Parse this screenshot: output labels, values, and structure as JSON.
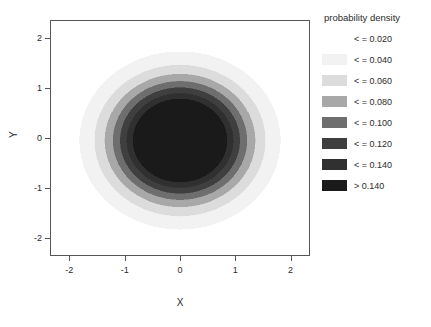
{
  "figure": {
    "background": "#ffffff",
    "frame_color": "#555555"
  },
  "legend": {
    "title": "probability density",
    "rows": [
      {
        "label": "< = 0.020",
        "color": "#ffffff"
      },
      {
        "label": "< = 0.040",
        "color": "#f2f2f2"
      },
      {
        "label": "< = 0.060",
        "color": "#dcdcdc"
      },
      {
        "label": "< = 0.080",
        "color": "#a8a8a8"
      },
      {
        "label": "< = 0.100",
        "color": "#6e6e6e"
      },
      {
        "label": "< = 0.120",
        "color": "#3f3f3f"
      },
      {
        "label": "< = 0.140",
        "color": "#303030"
      },
      {
        "label": "> 0.140",
        "color": "#1a1a1a"
      }
    ]
  },
  "axes": {
    "x": {
      "title": "X",
      "ticks": [
        "-2",
        "-1",
        "0",
        "1",
        "2"
      ],
      "tick_values": [
        -2,
        -1,
        0,
        1,
        2
      ],
      "range": [
        -2.35,
        2.35
      ]
    },
    "y": {
      "title": "Y",
      "ticks": [
        "-2",
        "-1",
        "0",
        "1",
        "2"
      ],
      "tick_values": [
        -2,
        -1,
        0,
        1,
        2
      ],
      "range": [
        -2.35,
        2.35
      ]
    }
  },
  "chart_data": {
    "type": "heatmap",
    "title": "",
    "subtitle": "",
    "xlabel": "X",
    "ylabel": "Y",
    "xlim": [
      -2.35,
      2.35
    ],
    "ylim": [
      -2.35,
      2.35
    ],
    "grid": false,
    "legend_position": "right",
    "legend_title": "probability density",
    "colorscale": "grayscale-discrete",
    "levels": [
      0.02,
      0.04,
      0.06,
      0.08,
      0.1,
      0.12,
      0.14
    ],
    "level_labels": [
      "< = 0.020",
      "< = 0.040",
      "< = 0.060",
      "< = 0.080",
      "< = 0.100",
      "< = 0.120",
      "< = 0.140",
      "> 0.140"
    ],
    "level_colors": [
      "#ffffff",
      "#f2f2f2",
      "#dcdcdc",
      "#a8a8a8",
      "#6e6e6e",
      "#3f3f3f",
      "#303030",
      "#1a1a1a"
    ],
    "surface": {
      "description": "bivariate gaussian probability density",
      "center_x": 0.0,
      "center_y": -0.05,
      "sigma_x": 0.82,
      "sigma_y": 0.8,
      "peak_density": 0.152
    },
    "contour_radii": [
      {
        "level": 0.02,
        "radius": 1.95
      },
      {
        "level": 0.04,
        "radius": 1.62
      },
      {
        "level": 0.06,
        "radius": 1.38
      },
      {
        "level": 0.08,
        "radius": 1.17
      },
      {
        "level": 0.1,
        "radius": 0.96
      },
      {
        "level": 0.12,
        "radius": 0.74
      },
      {
        "level": 0.14,
        "radius": 0.44
      }
    ]
  }
}
